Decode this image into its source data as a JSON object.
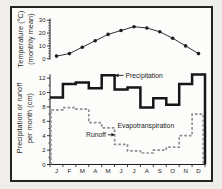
{
  "chart_data": [
    {
      "type": "line",
      "ylabel_line1": "Temperature (°C)",
      "ylabel_line2": "(monthly mean)",
      "categories": [
        "J",
        "F",
        "M",
        "A",
        "M",
        "J",
        "J",
        "A",
        "S",
        "O",
        "N",
        "D"
      ],
      "values": [
        2,
        4,
        9,
        14,
        19,
        22,
        25,
        24,
        21,
        16,
        10,
        4
      ],
      "ylim": [
        0,
        30
      ],
      "yticks": [
        0,
        10,
        20,
        30
      ],
      "marker": "filled-dot",
      "color": "#1b1b1b",
      "legend_position": "none",
      "grid": false
    },
    {
      "type": "step",
      "ylabel_line1": "Precipitation or runoff",
      "ylabel_line2": "per month (cm)",
      "categories": [
        "J",
        "F",
        "M",
        "A",
        "M",
        "J",
        "J",
        "A",
        "S",
        "O",
        "N",
        "D"
      ],
      "series": [
        {
          "name": "Precipitation",
          "line_style": "solid-thick",
          "color": "#161616",
          "values": [
            9.3,
            11.2,
            11.4,
            10.6,
            12.4,
            10.4,
            10.7,
            7.9,
            9.2,
            8.3,
            11.2,
            12.5
          ]
        },
        {
          "name": "Runoff",
          "line_style": "dashed",
          "color": "#8e8e8e",
          "values": [
            7.6,
            7.9,
            7.7,
            5.8,
            5.1,
            2.8,
            1.9,
            1.6,
            2.0,
            2.4,
            4.0,
            7.0
          ]
        }
      ],
      "ylim": [
        0,
        13
      ],
      "yticks": [
        0,
        2,
        4,
        6,
        8,
        10,
        12
      ],
      "annotations": [
        {
          "label": "Precipitation",
          "arrow": "left"
        },
        {
          "label": "Runoff",
          "arrow": "right"
        },
        {
          "label": "Evapotranspiration",
          "arrow": "none"
        }
      ],
      "grid": false
    }
  ]
}
